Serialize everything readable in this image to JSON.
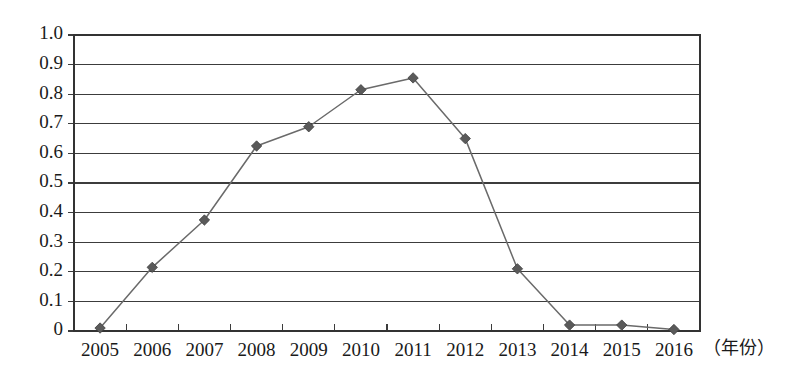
{
  "chart_data": {
    "type": "line",
    "title": "",
    "subtitle": "",
    "xlabel": "（年份）",
    "ylabel": "",
    "categories": [
      "2005",
      "2006",
      "2007",
      "2008",
      "2009",
      "2010",
      "2011",
      "2012",
      "2013",
      "2014",
      "2015",
      "2016"
    ],
    "values": [
      0.01,
      0.215,
      0.375,
      0.625,
      0.69,
      0.815,
      0.855,
      0.65,
      0.21,
      0.02,
      0.02,
      0.005
    ],
    "series": [
      {
        "name": "series-1",
        "values": [
          0.01,
          0.215,
          0.375,
          0.625,
          0.69,
          0.815,
          0.855,
          0.65,
          0.21,
          0.02,
          0.02,
          0.005
        ]
      }
    ],
    "ylim": [
      0,
      1.0
    ],
    "ytick_labels": [
      "0",
      "0.1",
      "0.2",
      "0.3",
      "0.4",
      "0.5",
      "0.6",
      "0.7",
      "0.8",
      "0.9",
      "1.0"
    ],
    "ytick_values": [
      0,
      0.1,
      0.2,
      0.3,
      0.4,
      0.5,
      0.6,
      0.7,
      0.8,
      0.9,
      1.0
    ],
    "grid": true,
    "grid_axis": "y",
    "legend": false,
    "legend_position": "none",
    "marker": "diamond",
    "line_color": "#6a6a6a",
    "marker_color": "#5a5a5a",
    "grid_color": "#3c3c3c",
    "axis_color": "#333333",
    "background_color": "#ffffff"
  },
  "axis": {
    "x_caption": "（年份）"
  }
}
